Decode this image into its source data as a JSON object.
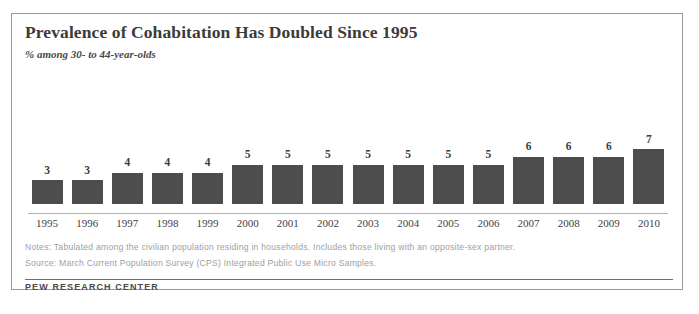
{
  "figure": {
    "title": "Prevalence of Cohabitation Has Doubled Since 1995",
    "subtitle": "% among 30- to 44-year-olds",
    "notes": "Notes: Tabulated among the civilian population residing in households. Includes those living with an opposite-sex partner.",
    "source": "Source: March Current Population Survey (CPS) Integrated Public Use Micro Samples.",
    "brand": "PEW RESEARCH CENTER",
    "colors": {
      "bar": "#4d4d4d",
      "border": "#9a9a9a",
      "title_text": "#3b3b3b",
      "note_text": "#9e9e9e"
    }
  },
  "chart_data": {
    "type": "bar",
    "title": "Prevalence of Cohabitation Has Doubled Since 1995",
    "subtitle": "% among 30- to 44-year-olds",
    "xlabel": "",
    "ylabel": "% among 30- to 44-year-olds",
    "ylim": [
      0,
      7
    ],
    "grid": false,
    "legend": false,
    "categories": [
      "1995",
      "1996",
      "1997",
      "1998",
      "1999",
      "2000",
      "2001",
      "2002",
      "2003",
      "2004",
      "2005",
      "2006",
      "2007",
      "2008",
      "2009",
      "2010"
    ],
    "values": [
      3,
      3,
      4,
      4,
      4,
      5,
      5,
      5,
      5,
      5,
      5,
      5,
      6,
      6,
      6,
      7
    ],
    "data_labels": [
      "3",
      "3",
      "4",
      "4",
      "4",
      "5",
      "5",
      "5",
      "5",
      "5",
      "5",
      "5",
      "6",
      "6",
      "6",
      "7"
    ]
  }
}
